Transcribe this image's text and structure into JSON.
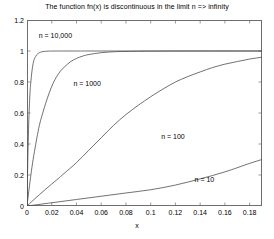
{
  "chart_data": {
    "type": "line",
    "title": "The function fn(x) is discontinuous in the limit n => infinity",
    "xlabel": "x",
    "ylabel": "fn(x)",
    "xlim": [
      0,
      0.19
    ],
    "ylim": [
      0,
      1.2
    ],
    "grid": false,
    "legend_position": "inline-annotations",
    "xticks": [
      0,
      0.02,
      0.04,
      0.06,
      0.08,
      0.1,
      0.12,
      0.14,
      0.16,
      0.18
    ],
    "xtick_labels": [
      "0",
      "0.02",
      "0.04",
      "0.06",
      "0.08",
      "0.1",
      "0.12",
      "0.14",
      "0.16",
      "0.18"
    ],
    "yticks": [
      0,
      0.2,
      0.4,
      0.6,
      0.8,
      1,
      1.2
    ],
    "ytick_labels": [
      "0",
      "0.2",
      "0.4",
      "0.6",
      "0.8",
      "1",
      "1.2"
    ],
    "line_color": "#4d4d4d",
    "box_color": "#6e6e6e",
    "background": "#ffffff",
    "series": [
      {
        "name": "n = 10,000",
        "label": "n = 10,000",
        "annotation_x": 0.0095,
        "annotation_y": 1.095,
        "n": 10000,
        "x": [
          0,
          0.0005,
          0.001,
          0.0015,
          0.002,
          0.0025,
          0.003,
          0.004,
          0.005,
          0.006,
          0.007,
          0.008,
          0.009,
          0.01,
          0.012,
          0.014,
          0.016,
          0.018,
          0.02,
          0.025,
          0.03,
          0.04,
          0.05,
          0.07,
          0.09,
          0.11,
          0.13,
          0.15,
          0.17,
          0.19
        ],
        "y": [
          0,
          0.23,
          0.42,
          0.56,
          0.66,
          0.74,
          0.79,
          0.87,
          0.92,
          0.95,
          0.965,
          0.977,
          0.984,
          0.989,
          0.995,
          0.9975,
          0.9988,
          0.9994,
          0.9997,
          0.99995,
          1,
          1,
          1,
          1,
          1,
          1,
          1,
          1,
          1,
          1
        ]
      },
      {
        "name": "n = 1000",
        "label": "n = 1000",
        "annotation_x": 0.0375,
        "annotation_y": 0.785,
        "n": 1000,
        "x": [
          0,
          0.002,
          0.004,
          0.006,
          0.008,
          0.01,
          0.012,
          0.015,
          0.018,
          0.021,
          0.024,
          0.027,
          0.03,
          0.035,
          0.04,
          0.045,
          0.05,
          0.06,
          0.07,
          0.08,
          0.1,
          0.12,
          0.14,
          0.16,
          0.19
        ],
        "y": [
          0,
          0.13,
          0.25,
          0.35,
          0.44,
          0.52,
          0.58,
          0.66,
          0.73,
          0.79,
          0.835,
          0.87,
          0.895,
          0.93,
          0.952,
          0.967,
          0.977,
          0.989,
          0.995,
          0.997,
          0.9993,
          0.9998,
          1,
          1,
          1
        ]
      },
      {
        "name": "n = 100",
        "label": "n = 100",
        "annotation_x": 0.1085,
        "annotation_y": 0.445,
        "n": 100,
        "x": [
          0,
          0.005,
          0.01,
          0.015,
          0.02,
          0.025,
          0.03,
          0.04,
          0.05,
          0.06,
          0.07,
          0.08,
          0.09,
          0.1,
          0.11,
          0.12,
          0.13,
          0.14,
          0.15,
          0.16,
          0.17,
          0.18,
          0.19
        ],
        "y": [
          0,
          0.037,
          0.073,
          0.108,
          0.142,
          0.175,
          0.21,
          0.28,
          0.36,
          0.44,
          0.52,
          0.59,
          0.65,
          0.705,
          0.755,
          0.8,
          0.835,
          0.865,
          0.893,
          0.915,
          0.932,
          0.948,
          0.96
        ]
      },
      {
        "name": "n = 10",
        "label": "n = 10",
        "annotation_x": 0.1355,
        "annotation_y": 0.165,
        "n": 10,
        "x": [
          0,
          0.02,
          0.04,
          0.06,
          0.08,
          0.1,
          0.12,
          0.14,
          0.16,
          0.18,
          0.19
        ],
        "y": [
          0,
          0.021,
          0.042,
          0.063,
          0.084,
          0.105,
          0.135,
          0.175,
          0.22,
          0.275,
          0.3
        ]
      }
    ]
  }
}
